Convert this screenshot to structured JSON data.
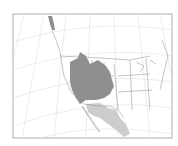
{
  "map": {
    "type": "range-map",
    "region": "Western North America",
    "projection": "conic",
    "colors": {
      "background": "#ffffff",
      "frame": "#9a9a9a",
      "graticule": "#d8d8d8",
      "borders": "#8c8c8c",
      "range_primary": "#8f8f8f",
      "range_secondary": "#cdcdcd"
    },
    "layers": [
      {
        "name": "range-primary",
        "description": "Dark gray: Great Basin / Rocky Mountain interior West, with a northern extension along Alaska panhandle coast"
      },
      {
        "name": "range-secondary",
        "description": "Light gray: southern Arizona/New Mexico and Mexican plateau, Baja region"
      }
    ]
  }
}
